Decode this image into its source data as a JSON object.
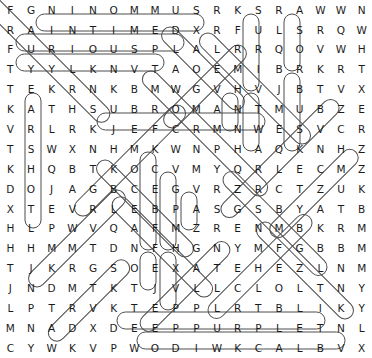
{
  "puzzle": {
    "title": "Word Search Puzzle",
    "type": "word-search",
    "rows": 18,
    "cols": 18,
    "letter_color": "#1b1b1b",
    "mark_color": "#4c4c4c",
    "background_color": "#ffffff",
    "grid": [
      [
        "F",
        "G",
        "N",
        "I",
        "N",
        "O",
        "M",
        "M",
        "U",
        "S",
        "R",
        "K",
        "S",
        "R",
        "A",
        "W",
        "W",
        "N"
      ],
      [
        "R",
        "A",
        "I",
        "N",
        "T",
        "I",
        "M",
        "E",
        "D",
        "X",
        "R",
        "F",
        "U",
        "L",
        "S",
        "R",
        "Q",
        "W"
      ],
      [
        "F",
        "U",
        "R",
        "I",
        "O",
        "U",
        "S",
        "P",
        "L",
        "A",
        "L",
        "R",
        "R",
        "Q",
        "O",
        "V",
        "W",
        "H"
      ],
      [
        "T",
        "Y",
        "Y",
        "L",
        "K",
        "N",
        "V",
        "T",
        "A",
        "O",
        "E",
        "M",
        "I",
        "B",
        "R",
        "K",
        "R",
        "T"
      ],
      [
        "T",
        "E",
        "K",
        "R",
        "N",
        "K",
        "B",
        "M",
        "W",
        "G",
        "V",
        "H",
        "V",
        "J",
        "B",
        "T",
        "V",
        "X"
      ],
      [
        "K",
        "A",
        "T",
        "H",
        "S",
        "U",
        "B",
        "R",
        "O",
        "M",
        "A",
        "N",
        "T",
        "M",
        "U",
        "B",
        "Z",
        "E"
      ],
      [
        "V",
        "R",
        "L",
        "R",
        "K",
        "J",
        "E",
        "F",
        "C",
        "R",
        "M",
        "N",
        "W",
        "E",
        "S",
        "V",
        "C",
        "R"
      ],
      [
        "T",
        "S",
        "W",
        "X",
        "N",
        "H",
        "M",
        "K",
        "W",
        "N",
        "P",
        "H",
        "A",
        "Q",
        "K",
        "N",
        "H",
        "Z"
      ],
      [
        "K",
        "H",
        "Q",
        "B",
        "T",
        "K",
        "O",
        "C",
        "V",
        "M",
        "Y",
        "Q",
        "R",
        "L",
        "E",
        "C",
        "M",
        "Z"
      ],
      [
        "D",
        "O",
        "J",
        "A",
        "G",
        "B",
        "C",
        "E",
        "G",
        "V",
        "R",
        "Z",
        "R",
        "C",
        "T",
        "Z",
        "U",
        "K"
      ],
      [
        "X",
        "T",
        "E",
        "V",
        "R",
        "L",
        "E",
        "B",
        "P",
        "A",
        "S",
        "G",
        "S",
        "B",
        "Y",
        "A",
        "T",
        "B"
      ],
      [
        "H",
        "L",
        "P",
        "W",
        "V",
        "Q",
        "A",
        "F",
        "M",
        "Z",
        "R",
        "E",
        "N",
        "M",
        "B",
        "K",
        "R",
        "M"
      ],
      [
        "H",
        "H",
        "M",
        "M",
        "T",
        "D",
        "N",
        "F",
        "H",
        "G",
        "N",
        "Y",
        "M",
        "F",
        "G",
        "B",
        "B",
        "M"
      ],
      [
        "T",
        "J",
        "K",
        "R",
        "G",
        "S",
        "O",
        "E",
        "X",
        "A",
        "T",
        "E",
        "H",
        "E",
        "Z",
        "L",
        "N",
        "M"
      ],
      [
        "J",
        "N",
        "D",
        "M",
        "T",
        "K",
        "T",
        "J",
        "V",
        "L",
        "L",
        "C",
        "L",
        "O",
        "L",
        "T",
        "N",
        "Y"
      ],
      [
        "L",
        "P",
        "T",
        "R",
        "V",
        "K",
        "T",
        "E",
        "P",
        "P",
        "L",
        "R",
        "T",
        "B",
        "L",
        "I",
        "K",
        "Y"
      ],
      [
        "M",
        "N",
        "A",
        "D",
        "X",
        "D",
        "E",
        "E",
        "P",
        "P",
        "U",
        "R",
        "P",
        "L",
        "E",
        "T",
        "N",
        "L"
      ],
      [
        "C",
        "Y",
        "W",
        "K",
        "V",
        "P",
        "W",
        "O",
        "D",
        "I",
        "W",
        "K",
        "C",
        "A",
        "L",
        "B",
        "V",
        "X"
      ]
    ],
    "found_words": [
      {
        "word": "SUMMONING",
        "direction": "horizontal-reversed",
        "row": 0,
        "start_col": 1,
        "end_col": 9
      },
      {
        "word": "RAINTIME",
        "direction": "horizontal",
        "row": 1,
        "start_col": 0,
        "end_col": 7
      },
      {
        "word": "FURIOUS",
        "direction": "horizontal",
        "row": 2,
        "start_col": 0,
        "end_col": 6
      },
      {
        "word": "SUBROMAN",
        "direction": "horizontal",
        "row": 5,
        "start_col": 4,
        "end_col": 11
      },
      {
        "word": "DEEPPURPLE",
        "direction": "horizontal",
        "row": 16,
        "start_col": 5,
        "end_col": 14
      },
      {
        "word": "BLACKWIDOW",
        "direction": "horizontal-reversed",
        "row": 17,
        "start_col": 6,
        "end_col": 15
      },
      {
        "word": "SURI",
        "direction": "vertical",
        "col": 12,
        "start_row": 0,
        "end_row": 3
      },
      {
        "word": "ASO",
        "direction": "vertical",
        "col": 14,
        "start_row": 0,
        "end_row": 2
      },
      {
        "word": "EARSHOT",
        "direction": "vertical",
        "col": 1,
        "start_row": 4,
        "end_row": 10
      },
      {
        "word": "VA",
        "direction": "vertical",
        "col": 10,
        "start_row": 4,
        "end_row": 5
      },
      {
        "word": "VJ",
        "direction": "vertical",
        "col": 12,
        "start_row": 4,
        "end_row": 5
      },
      {
        "word": "BRUS",
        "direction": "vertical",
        "col": 14,
        "start_row": 3,
        "end_row": 6
      },
      {
        "word": "KOCEBA",
        "direction": "vertical",
        "col": 6,
        "start_row": 7,
        "end_row": 11
      },
      {
        "word": "CEBF",
        "direction": "vertical",
        "col": 7,
        "start_row": 8,
        "end_row": 11
      },
      {
        "word": "GRAS",
        "direction": "vertical",
        "col": 8,
        "start_row": 9,
        "end_row": 10
      },
      {
        "word": "LTL",
        "direction": "vertical",
        "col": 1,
        "start_row": 9,
        "end_row": 11
      },
      {
        "word": "SOEJ",
        "direction": "vertical",
        "col": 6,
        "start_row": 13,
        "end_row": 14
      },
      {
        "word": "EJ",
        "direction": "vertical",
        "col": 7,
        "start_row": 13,
        "end_row": 15
      }
    ]
  }
}
